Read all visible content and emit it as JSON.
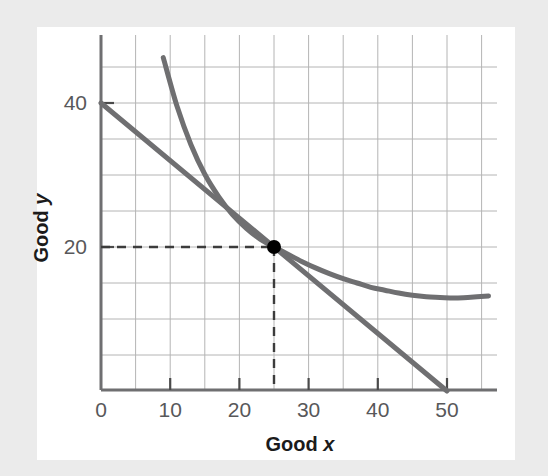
{
  "figure": {
    "background_color": "#ebebeb",
    "card_color": "#ffffff"
  },
  "chart_data": {
    "type": "line",
    "title": "",
    "subtitle": "",
    "xlabel_prefix": "Good ",
    "xlabel_symbol": "x",
    "ylabel_prefix": "Good ",
    "ylabel_symbol": "y",
    "xlim": [
      0,
      56
    ],
    "ylim": [
      0,
      48
    ],
    "xticks": [
      0,
      10,
      20,
      30,
      40,
      50
    ],
    "xtick_labels": [
      "0",
      "10",
      "20",
      "30",
      "40",
      "50"
    ],
    "yticks": [
      20,
      40
    ],
    "ytick_labels": [
      "20",
      "40"
    ],
    "grid": true,
    "grid_spacing_x": 5,
    "grid_spacing_y": 5,
    "grid_color": "#b4b4b4",
    "axis_color": "#6e6e6e",
    "legend": "none",
    "series": [
      {
        "name": "budget-line",
        "type": "line",
        "color": "#6f6f71",
        "linewidth": 5,
        "points": [
          [
            0,
            40
          ],
          [
            50,
            0
          ]
        ],
        "annotation": "Budget line from (0, 40) to (50, 0)"
      },
      {
        "name": "indifference-curve",
        "type": "curve",
        "color": "#6f6f71",
        "linewidth": 5,
        "points": [
          [
            9,
            46.3
          ],
          [
            11,
            39.5
          ],
          [
            13,
            34.2
          ],
          [
            15,
            30.1
          ],
          [
            17,
            27.0
          ],
          [
            19,
            24.5
          ],
          [
            21,
            22.6
          ],
          [
            23,
            21.1
          ],
          [
            25,
            20.0
          ],
          [
            27,
            19.0
          ],
          [
            29,
            18.0
          ],
          [
            31,
            17.1
          ],
          [
            33,
            16.3
          ],
          [
            35,
            15.6
          ],
          [
            37,
            15.0
          ],
          [
            39,
            14.4
          ],
          [
            41,
            14.0
          ],
          [
            43,
            13.6
          ],
          [
            45,
            13.3
          ],
          [
            47,
            13.1
          ],
          [
            49,
            13.0
          ],
          [
            51,
            12.9
          ],
          [
            53,
            13.0
          ],
          [
            56,
            13.2
          ]
        ],
        "annotation": "Indifference curve convex to origin"
      }
    ],
    "annotations": [
      {
        "name": "tangency-point",
        "x": 25,
        "y": 20,
        "marker": "filled-circle",
        "color": "#000000",
        "radius": 7
      },
      {
        "name": "guide-line-horizontal",
        "from": [
          0,
          20
        ],
        "to": [
          25,
          20
        ],
        "style": "dashed",
        "color": "#3c3c3c"
      },
      {
        "name": "guide-line-vertical",
        "from": [
          25,
          20
        ],
        "to": [
          25,
          0
        ],
        "style": "dashed",
        "color": "#3c3c3c"
      }
    ]
  }
}
